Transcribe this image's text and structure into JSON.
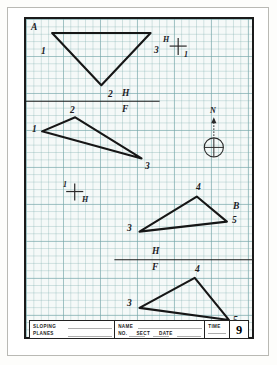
{
  "sheet": {
    "corner_label_a": "A",
    "corner_label_b": "B"
  },
  "title_block": {
    "subject_line_1": "SLOPING",
    "subject_line_2": "PLANES",
    "name_label": "NAME",
    "no_label": "NO.",
    "sect_label": "SECT",
    "date_label": "DATE",
    "time_label": "TIME",
    "sheet_number": "9"
  },
  "reference_lines": [
    {
      "name": "hf-line-upper",
      "h_label": "H",
      "f_label": "F"
    },
    {
      "name": "hf-line-lower",
      "h_label": "H",
      "f_label": "F"
    }
  ],
  "fold_markers": [
    {
      "name": "fold-marker-h1",
      "top_label": "H",
      "bottom_label": "1"
    },
    {
      "name": "fold-marker-1h",
      "top_label": "1",
      "bottom_label": "H"
    }
  ],
  "north_arrow": {
    "label": "N"
  },
  "triangles": [
    {
      "name": "triangle-top-front-view",
      "points": "26,14 124,14 75,66",
      "vertex_labels": [
        {
          "text": "1",
          "x": 15,
          "y": 28
        },
        {
          "text": "3",
          "x": 128,
          "y": 27
        },
        {
          "text": "2",
          "x": 82,
          "y": 73
        }
      ]
    },
    {
      "name": "triangle-upper-top-view",
      "points": "49,98 16,112 115,139",
      "vertex_labels": [
        {
          "text": "2",
          "x": 45,
          "y": 92
        },
        {
          "text": "1",
          "x": 7,
          "y": 111
        },
        {
          "text": "3",
          "x": 119,
          "y": 148
        }
      ]
    },
    {
      "name": "triangle-right-front-view",
      "points": "170,177 200,202 113,212",
      "vertex_labels": [
        {
          "text": "4",
          "x": 170,
          "y": 170
        },
        {
          "text": "5",
          "x": 206,
          "y": 203
        },
        {
          "text": "3",
          "x": 102,
          "y": 209
        }
      ]
    },
    {
      "name": "triangle-right-top-view",
      "points": "168,258 202,300 113,288",
      "vertex_labels": [
        {
          "text": "4",
          "x": 170,
          "y": 252
        },
        {
          "text": "5",
          "x": 207,
          "y": 303
        },
        {
          "text": "3",
          "x": 102,
          "y": 285
        }
      ]
    }
  ],
  "colors": {
    "ink": "#1a1a1a",
    "grid": "#6ea0a5",
    "paper": "#f5f9f8"
  }
}
